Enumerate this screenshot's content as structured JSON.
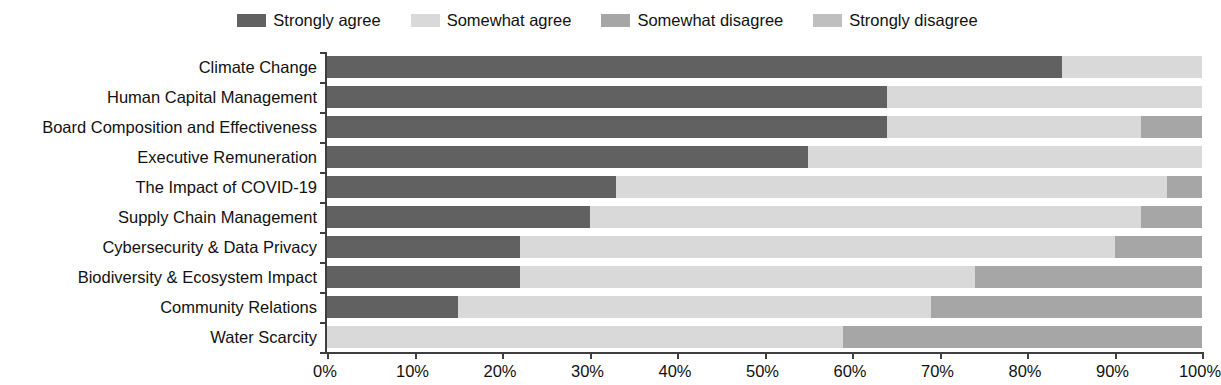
{
  "chart_data": {
    "type": "bar",
    "subtype": "stacked-horizontal-100pct",
    "title": "",
    "subtitle": "",
    "xlabel": "",
    "ylabel": "",
    "xlim": [
      0,
      100
    ],
    "x_tick_labels": [
      "0%",
      "10%",
      "20%",
      "30%",
      "40%",
      "50%",
      "60%",
      "70%",
      "80%",
      "90%",
      "100%"
    ],
    "x_tick_values": [
      0,
      10,
      20,
      30,
      40,
      50,
      60,
      70,
      80,
      90,
      100
    ],
    "grid": false,
    "legend_position": "top-center",
    "categories": [
      "Climate Change",
      "Human Capital Management",
      "Board Composition and Effectiveness",
      "Executive Remuneration",
      "The Impact of COVID-19",
      "Supply Chain Management",
      "Cybersecurity & Data Privacy",
      "Biodiversity & Ecosystem Impact",
      "Community Relations",
      "Water Scarcity"
    ],
    "series": [
      {
        "name": "Strongly agree",
        "color": "#616161",
        "values": [
          84,
          64,
          64,
          55,
          33,
          30,
          22,
          22,
          15,
          0
        ]
      },
      {
        "name": "Somewhat agree",
        "color": "#d9d9d9",
        "values": [
          16,
          36,
          29,
          45,
          63,
          63,
          68,
          52,
          54,
          59
        ]
      },
      {
        "name": "Somewhat disagree",
        "color": "#a6a6a6",
        "values": [
          0,
          0,
          7,
          0,
          4,
          7,
          10,
          26,
          31,
          41
        ]
      },
      {
        "name": "Strongly disagree",
        "color": "#bfbfbf",
        "values": [
          0,
          0,
          0,
          0,
          0,
          0,
          0,
          0,
          0,
          0
        ]
      }
    ]
  },
  "legend": {
    "items": [
      {
        "label": "Strongly agree",
        "color": "#616161"
      },
      {
        "label": "Somewhat agree",
        "color": "#d9d9d9"
      },
      {
        "label": "Somewhat disagree",
        "color": "#a6a6a6"
      },
      {
        "label": "Strongly disagree",
        "color": "#bfbfbf"
      }
    ]
  },
  "axis": {
    "line_color": "#3f3f3f"
  }
}
